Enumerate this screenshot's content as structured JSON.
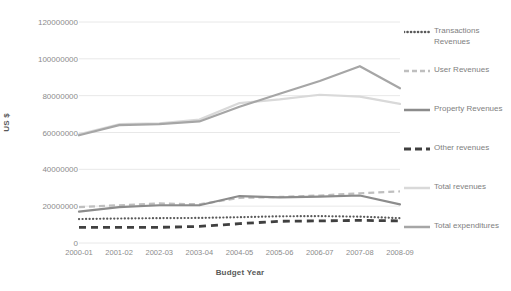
{
  "chart_data": {
    "type": "line",
    "title": "",
    "xlabel": "Budget Year",
    "ylabel": "US $",
    "categories": [
      "2000-01",
      "2001-02",
      "2002-03",
      "2003-04",
      "2004-05",
      "2005-06",
      "2006-07",
      "2007-08",
      "2008-09"
    ],
    "ylim": [
      0,
      120000000
    ],
    "ytick_values": [
      0,
      20000000,
      40000000,
      60000000,
      80000000,
      100000000,
      120000000
    ],
    "ytick_labels": [
      "0",
      "20000000",
      "40000000",
      "60000000",
      "80000000",
      "100000000",
      "120000000"
    ],
    "grid": true,
    "legend_position": "right",
    "series": [
      {
        "name": "Transactions Revenues",
        "style": "dotted",
        "color": "#595959",
        "values": [
          13000000,
          13300000,
          13500000,
          13600000,
          14000000,
          14500000,
          14600000,
          14300000,
          13500000
        ]
      },
      {
        "name": "User Revenues",
        "style": "dashed",
        "color": "#bfbfbf",
        "values": [
          19500000,
          20500000,
          21500000,
          21000000,
          24500000,
          25000000,
          25800000,
          27000000,
          28000000
        ]
      },
      {
        "name": "Property Revenues",
        "style": "solid",
        "color": "#8c8c8c",
        "values": [
          17000000,
          19500000,
          20500000,
          20500000,
          25500000,
          24800000,
          25200000,
          25800000,
          21000000
        ]
      },
      {
        "name": "Other revenues",
        "style": "dashed-bold",
        "color": "#404040",
        "values": [
          8500000,
          8500000,
          8500000,
          9000000,
          10500000,
          11800000,
          12000000,
          12300000,
          12000000
        ]
      },
      {
        "name": "Total revenues",
        "style": "solid",
        "color": "#d9d9d9",
        "values": [
          59000000,
          64500000,
          65000000,
          67000000,
          76000000,
          78000000,
          80500000,
          79500000,
          75500000
        ]
      },
      {
        "name": "Total expenditures",
        "style": "solid",
        "color": "#a6a6a6",
        "values": [
          58500000,
          64000000,
          64500000,
          66000000,
          74000000,
          81000000,
          88000000,
          96000000,
          84000000
        ]
      }
    ]
  },
  "legend": {
    "items": [
      {
        "label": "Transactions Revenues",
        "icon": "dotted-line-icon"
      },
      {
        "label": "User Revenues",
        "icon": "dashed-line-icon"
      },
      {
        "label": "Property Revenues",
        "icon": "solid-line-icon"
      },
      {
        "label": "Other revenues",
        "icon": "bold-dashed-line-icon"
      },
      {
        "label": "Total revenues",
        "icon": "light-solid-line-icon"
      },
      {
        "label": "Total expenditures",
        "icon": "solid-line-icon"
      }
    ]
  }
}
